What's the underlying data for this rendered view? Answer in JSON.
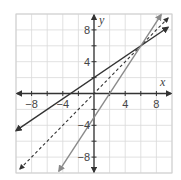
{
  "chart_data": {
    "type": "line",
    "title": "",
    "xlabel": "x",
    "ylabel": "y",
    "xlim": [
      -10,
      10
    ],
    "ylim": [
      -10,
      10
    ],
    "grid": true,
    "grid_step": 2,
    "x_ticks": [
      -8,
      -4,
      4,
      8
    ],
    "y_ticks": [
      8,
      4,
      -4,
      -8
    ],
    "x_tick_labels": [
      "−8",
      "−4",
      "4",
      "8"
    ],
    "y_tick_labels": [
      "8",
      "4",
      "−4",
      "−8"
    ],
    "series": [
      {
        "name": "line-dark",
        "style": "solid",
        "color": "#333333",
        "equation": "y = (2/3)x + 2",
        "slope": 0.6667,
        "intercept": 2,
        "points": [
          [
            -10,
            -4.67
          ],
          [
            9.5,
            8.33
          ]
        ]
      },
      {
        "name": "line-dashed",
        "style": "dashed",
        "color": "#333333",
        "equation": "y = x",
        "slope": 1,
        "intercept": 0,
        "points": [
          [
            -9.5,
            -9.5
          ],
          [
            9.5,
            9.5
          ]
        ]
      },
      {
        "name": "line-gray",
        "style": "solid",
        "color": "#8a8a8a",
        "equation": "y = 1.5x - 3",
        "slope": 1.5,
        "intercept": -3,
        "points": [
          [
            -4.5,
            -9.75
          ],
          [
            8.6,
            9.9
          ]
        ]
      }
    ],
    "intersection": [
      6,
      6
    ],
    "legend": "none"
  },
  "axes": {
    "x_label": "x",
    "y_label": "y"
  },
  "colors": {
    "grid": "#d9d9d9",
    "axis": "#333333",
    "border": "#d0d0d0"
  }
}
